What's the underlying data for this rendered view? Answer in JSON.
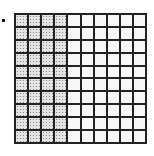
{
  "figure": {
    "label": ".",
    "rows": 10,
    "columns": 10,
    "shaded_columns": 4,
    "shaded_cells": 40,
    "total_cells": 100,
    "shade_pattern": "dotted",
    "colors": {
      "grid_line": "#222222",
      "shaded_fill": "#e4e4e4",
      "unshaded_fill": "#f7f7f7"
    }
  }
}
